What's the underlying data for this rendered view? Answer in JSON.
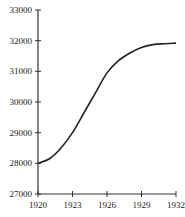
{
  "chart_data": {
    "type": "line",
    "title": "",
    "xlabel": "",
    "ylabel": "",
    "x": [
      1920,
      1921,
      1922,
      1923,
      1924,
      1925,
      1926,
      1927,
      1928,
      1929,
      1930,
      1931,
      1932
    ],
    "series": [
      {
        "name": "",
        "values": [
          28000,
          28150,
          28500,
          29000,
          29650,
          30300,
          30950,
          31350,
          31600,
          31780,
          31870,
          31900,
          31920
        ]
      }
    ],
    "xlim": [
      1920,
      1932
    ],
    "ylim": [
      27000,
      33000
    ],
    "xticks": [
      "1920",
      "1923",
      "1926",
      "1929",
      "1932"
    ],
    "yticks": [
      "27000",
      "28000",
      "29000",
      "30000",
      "31000",
      "32000",
      "33000"
    ],
    "grid": false,
    "legend": "none",
    "line_color": "#222222"
  }
}
